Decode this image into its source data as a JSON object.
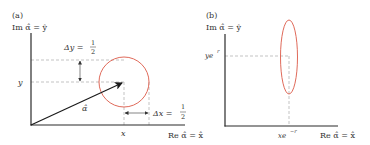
{
  "figure": {
    "colors": {
      "axis": "#2a2a2a",
      "dashed": "#9a9a9a",
      "shape": "#e06a5a",
      "arrow": "#1a1a1a",
      "text": "#333333"
    },
    "panel_a": {
      "label": "(a)",
      "y_axis_label": "Im α̂ = ŷ",
      "x_axis_label": "Re α̂ = x̂",
      "x_tick": "x",
      "y_tick": "y",
      "vector_label": "α̂",
      "delta_y": {
        "lhs": "Δy =",
        "num": "1",
        "den": "2"
      },
      "delta_x": {
        "lhs": "Δx =",
        "num": "1",
        "den": "2"
      },
      "shape": "circle"
    },
    "panel_b": {
      "label": "(b)",
      "y_axis_label": "Im α̂ = ŷ",
      "x_axis_label": "Re α̂ = x̂",
      "x_tick": "xe",
      "x_tick_sup": "−r",
      "y_tick": "ye",
      "y_tick_sup": "r",
      "shape": "ellipse"
    }
  }
}
